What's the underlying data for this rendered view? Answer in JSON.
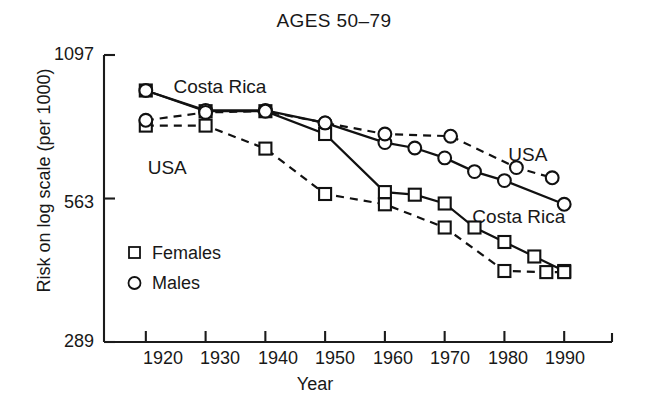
{
  "chart_data": {
    "type": "line",
    "title": "AGES 50–79",
    "xlabel": "Year",
    "ylabel": "Risk on log scale (per 1000)",
    "yscale": "log",
    "ylim": [
      289,
      1097
    ],
    "xlim": [
      1913,
      1998
    ],
    "ytick_labels": [
      "1097",
      "563",
      "289"
    ],
    "ytick_values": [
      1097,
      563,
      289
    ],
    "xtick_labels": [
      "1920",
      "1930",
      "1940",
      "1950",
      "1960",
      "1970",
      "1980",
      "1990"
    ],
    "xtick_values": [
      1920,
      1930,
      1940,
      1950,
      1960,
      1970,
      1980,
      1990
    ],
    "grid": false,
    "legend_position": "inside-lower-left",
    "legend": [
      {
        "label": "Females",
        "marker": "square"
      },
      {
        "label": "Males",
        "marker": "circle"
      }
    ],
    "annotations": [
      {
        "text": "Costa Rica",
        "x": 1934,
        "y": 935
      },
      {
        "text": "USA",
        "x": 1925,
        "y": 655
      },
      {
        "text": "USA",
        "x": 1985,
        "y": 690
      },
      {
        "text": "Costa Rica",
        "x": 1983,
        "y": 520
      }
    ],
    "series": [
      {
        "name": "Costa Rica Females",
        "country": "Costa Rica",
        "sex": "Females",
        "marker": "square",
        "line": "solid",
        "x": [
          1920,
          1930,
          1940,
          1950,
          1960,
          1965,
          1970,
          1975,
          1980,
          1985,
          1990
        ],
        "values": [
          930,
          845,
          845,
          760,
          580,
          573,
          550,
          492,
          460,
          430,
          402
        ]
      },
      {
        "name": "Costa Rica Males",
        "country": "Costa Rica",
        "sex": "Males",
        "marker": "circle",
        "line": "solid",
        "x": [
          1920,
          1930,
          1940,
          1950,
          1960,
          1965,
          1970,
          1975,
          1980,
          1990
        ],
        "values": [
          930,
          848,
          848,
          800,
          730,
          712,
          680,
          638,
          612,
          548
        ]
      },
      {
        "name": "USA Females",
        "country": "USA",
        "sex": "Females",
        "marker": "square",
        "line": "dashed",
        "x": [
          1920,
          1930,
          1940,
          1950,
          1960,
          1970,
          1980,
          1987,
          1990
        ],
        "values": [
          790,
          790,
          710,
          575,
          548,
          492,
          402,
          400,
          400
        ]
      },
      {
        "name": "USA Males",
        "country": "USA",
        "sex": "Males",
        "marker": "circle",
        "line": "dashed",
        "x": [
          1920,
          1930,
          1940,
          1950,
          1960,
          1971,
          1982,
          1988
        ],
        "values": [
          810,
          840,
          845,
          800,
          760,
          752,
          650,
          620
        ]
      }
    ]
  }
}
